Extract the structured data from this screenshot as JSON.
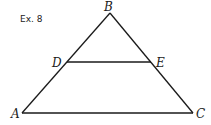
{
  "exercise_label": "Ex. 8",
  "points": {
    "A": {
      "label": "A",
      "x": 22,
      "y": 113
    },
    "B": {
      "label": "B",
      "x": 110,
      "y": 13
    },
    "C": {
      "label": "C",
      "x": 193,
      "y": 113
    },
    "D": {
      "label": "D",
      "x": 67,
      "y": 62
    },
    "E": {
      "label": "E",
      "x": 151,
      "y": 62
    }
  },
  "segments": [
    "AB",
    "BC",
    "AC",
    "DE"
  ],
  "colors": {
    "stroke": "#1a1a1a",
    "background": "#ffffff"
  }
}
